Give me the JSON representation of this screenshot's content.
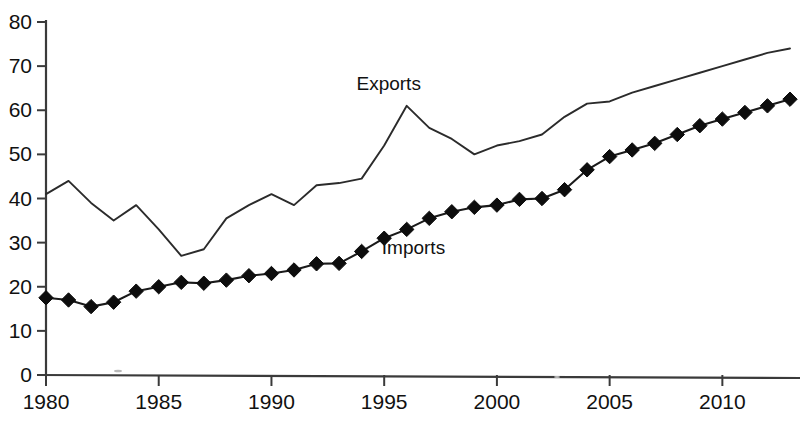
{
  "chart_data": {
    "type": "line",
    "title": "",
    "subtitle": "",
    "xlabel": "",
    "ylabel": "",
    "xlim": [
      1980,
      2013
    ],
    "ylim": [
      0,
      80
    ],
    "grid": false,
    "legend_position": "inline-annotation",
    "x_tick_labels": [
      "1980",
      "1985",
      "1990",
      "1995",
      "2000",
      "2005",
      "2010"
    ],
    "x_tick_values": [
      1980,
      1985,
      1990,
      1995,
      2000,
      2005,
      2010
    ],
    "y_tick_labels": [
      "0",
      "10",
      "20",
      "30",
      "40",
      "50",
      "60",
      "70",
      "80"
    ],
    "y_tick_values": [
      0,
      10,
      20,
      30,
      40,
      50,
      60,
      70,
      80
    ],
    "x": [
      1980,
      1981,
      1982,
      1983,
      1984,
      1985,
      1986,
      1987,
      1988,
      1989,
      1990,
      1991,
      1992,
      1993,
      1994,
      1995,
      1996,
      1997,
      1998,
      1999,
      2000,
      2001,
      2002,
      2003,
      2004,
      2005,
      2006,
      2007,
      2008,
      2009,
      2010,
      2011,
      2012,
      2013
    ],
    "series": [
      {
        "name": "Exports",
        "marker": "none",
        "color": "#2b2b2b",
        "annotation": "Exports",
        "annotation_x": 1995.2,
        "annotation_y": 64.5,
        "values": [
          41.0,
          44.0,
          39.0,
          35.0,
          38.5,
          33.0,
          27.0,
          28.5,
          35.5,
          38.5,
          41.0,
          38.5,
          43.0,
          43.5,
          44.5,
          52.0,
          61.0,
          56.0,
          53.5,
          50.0,
          52.0,
          53.0,
          54.5,
          58.5,
          61.5,
          62.0,
          64.0,
          65.5,
          67.0,
          68.5,
          70.0,
          71.5,
          73.0,
          74.0
        ]
      },
      {
        "name": "Imports",
        "marker": "diamond",
        "color": "#0d0d0d",
        "annotation": "Imports",
        "annotation_x": 1996.3,
        "annotation_y": 27.5,
        "values": [
          17.5,
          17.0,
          15.5,
          16.5,
          19.0,
          20.0,
          21.0,
          20.8,
          21.5,
          22.5,
          23.0,
          23.8,
          25.2,
          25.3,
          28.0,
          31.0,
          33.0,
          35.5,
          37.0,
          38.0,
          38.5,
          39.8,
          40.0,
          42.0,
          46.5,
          49.5,
          51.0,
          52.5,
          54.5,
          56.5,
          58.0,
          59.5,
          61.0,
          62.5
        ]
      }
    ]
  }
}
